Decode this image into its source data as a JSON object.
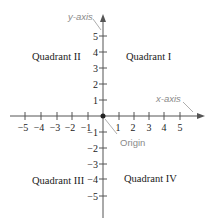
{
  "diagram": {
    "labels": {
      "y_axis": "y-axis",
      "x_axis": "x-axis",
      "origin": "Origin"
    },
    "quadrants": {
      "q1": "Quadrant I",
      "q2": "Quadrant II",
      "q3": "Quadrant III",
      "q4": "Quadrant IV"
    },
    "x_ticks": [
      "−5",
      "−4",
      "−3",
      "−2",
      "−1",
      "1",
      "2",
      "3",
      "4",
      "5"
    ],
    "y_ticks": [
      "5",
      "4",
      "3",
      "2",
      "1",
      "−1",
      "−2",
      "−3",
      "−4",
      "−5"
    ],
    "colors": {
      "axis": "#444444",
      "label_gray": "#8a8a8a",
      "text": "#222222"
    }
  }
}
